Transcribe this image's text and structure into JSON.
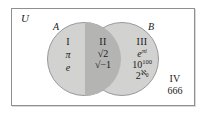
{
  "figure": {
    "type": "venn-diagram",
    "universe_label": "U",
    "set_labels": {
      "a": "A",
      "b": "B"
    },
    "colors": {
      "frame": "#8d8f93",
      "circle_fill": "#d2d2d0",
      "circle_stroke": "#97999d",
      "intersection_fill": "#b4b4b2",
      "background": "#ffffff",
      "text": "#1a1a1a"
    }
  },
  "regions": [
    {
      "numeral": "I",
      "name": "a-only",
      "items": [
        {
          "base": "π",
          "sup": "",
          "sub": "",
          "italic": true
        }
      ]
    },
    {
      "numeral": "II",
      "name": "a-intersect-b",
      "items": []
    },
    {
      "numeral": "III",
      "name": "b-only",
      "items": []
    },
    {
      "numeral": "IV",
      "name": "outside-both",
      "items": []
    }
  ],
  "region_1": {
    "numeral": "I",
    "item_1": "π",
    "item_2": "e"
  },
  "region_2": {
    "numeral": "II",
    "radical_1_radicand": "2",
    "radical_2_radicand": "−1"
  },
  "region_3": {
    "numeral": "III",
    "item_1_base": "e",
    "item_1_sup": "πi",
    "item_2_base": "10",
    "item_2_sup": "100",
    "item_3_base": "2",
    "item_3_sup": "ℵ",
    "item_3_sup_sub": "0"
  },
  "region_4": {
    "numeral": "IV",
    "item_1": "666"
  }
}
